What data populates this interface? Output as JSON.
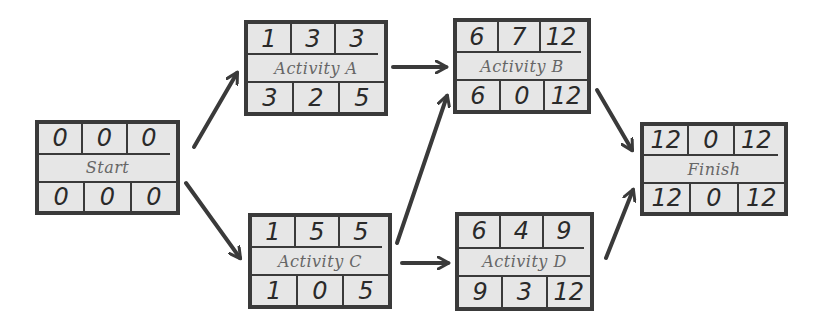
{
  "diagram": {
    "type": "activity-on-node network",
    "legend_layout": {
      "top_row": [
        "ES",
        "Duration",
        "EF"
      ],
      "bottom_row": [
        "LS",
        "Float",
        "LF"
      ]
    },
    "nodes": [
      {
        "id": "start",
        "name": "Start",
        "top": [
          "0",
          "0",
          "0"
        ],
        "bottom": [
          "0",
          "0",
          "0"
        ],
        "box": {
          "x": 35,
          "y": 120,
          "w": 145,
          "h": 95
        }
      },
      {
        "id": "a",
        "name": "Activity A",
        "top": [
          "1",
          "3",
          "3"
        ],
        "bottom": [
          "3",
          "2",
          "5"
        ],
        "box": {
          "x": 244,
          "y": 20,
          "w": 144,
          "h": 96
        }
      },
      {
        "id": "b",
        "name": "Activity B",
        "top": [
          "6",
          "7",
          "12"
        ],
        "bottom": [
          "6",
          "0",
          "12"
        ],
        "box": {
          "x": 453,
          "y": 18,
          "w": 138,
          "h": 96
        }
      },
      {
        "id": "c",
        "name": "Activity C",
        "top": [
          "1",
          "5",
          "5"
        ],
        "bottom": [
          "1",
          "0",
          "5"
        ],
        "box": {
          "x": 248,
          "y": 213,
          "w": 144,
          "h": 96
        }
      },
      {
        "id": "d",
        "name": "Activity D",
        "top": [
          "6",
          "4",
          "9"
        ],
        "bottom": [
          "9",
          "3",
          "12"
        ],
        "box": {
          "x": 455,
          "y": 212,
          "w": 139,
          "h": 99
        }
      },
      {
        "id": "finish",
        "name": "Finish",
        "top": [
          "12",
          "0",
          "12"
        ],
        "bottom": [
          "12",
          "0",
          "12"
        ],
        "box": {
          "x": 640,
          "y": 122,
          "w": 148,
          "h": 94
        }
      }
    ],
    "edges": [
      {
        "from": "start",
        "to": "a"
      },
      {
        "from": "start",
        "to": "c"
      },
      {
        "from": "a",
        "to": "b"
      },
      {
        "from": "c",
        "to": "b"
      },
      {
        "from": "c",
        "to": "d"
      },
      {
        "from": "b",
        "to": "finish"
      },
      {
        "from": "d",
        "to": "finish"
      }
    ],
    "colors": {
      "stroke": "#3a3a3a",
      "fill": "#e6e6e6",
      "background": "#ffffff"
    }
  }
}
